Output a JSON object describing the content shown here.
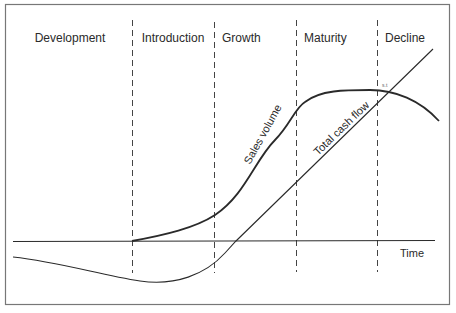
{
  "diagram": {
    "phases": [
      {
        "label": "Development"
      },
      {
        "label": "Introduction"
      },
      {
        "label": "Growth"
      },
      {
        "label": "Maturity"
      },
      {
        "label": "Decline"
      }
    ],
    "curves": {
      "sales_volume": {
        "label": "Sales volume"
      },
      "total_cash_flow": {
        "label": "Total cash flow"
      }
    },
    "axis": {
      "x_label": "Time"
    },
    "annotation": {
      "label": "s.t"
    },
    "colors": {
      "line": "#2a2a2a",
      "border": "#777777",
      "background": "#ffffff"
    }
  }
}
